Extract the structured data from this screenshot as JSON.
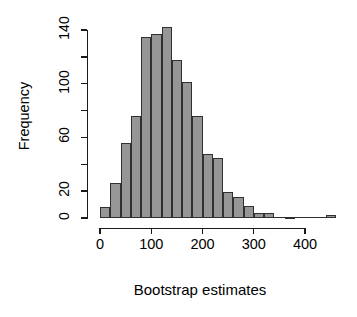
{
  "chart_data": {
    "type": "bar",
    "subtype": "histogram",
    "title": "",
    "xlabel": "Bootstrap estimates",
    "ylabel": "Frequency",
    "xlim": [
      0,
      460
    ],
    "ylim": [
      0,
      145
    ],
    "grid": false,
    "legend": null,
    "bin_width": 20,
    "bar_fill_color": "#969696",
    "bar_border_color": "#303030",
    "axis_color": "#1a1a1a",
    "background_color": "#ffffff",
    "x_ticks": [
      {
        "value": 0,
        "label": "0"
      },
      {
        "value": 100,
        "label": "100"
      },
      {
        "value": 200,
        "label": "200"
      },
      {
        "value": 300,
        "label": "300"
      },
      {
        "value": 400,
        "label": "400"
      }
    ],
    "y_ticks": [
      {
        "value": 0,
        "label": "0",
        "major": true
      },
      {
        "value": 20,
        "label": "20",
        "major": true
      },
      {
        "value": 40,
        "label": "",
        "major": false
      },
      {
        "value": 60,
        "label": "60",
        "major": true
      },
      {
        "value": 80,
        "label": "",
        "major": false
      },
      {
        "value": 100,
        "label": "100",
        "major": true
      },
      {
        "value": 120,
        "label": "",
        "major": false
      },
      {
        "value": 140,
        "label": "140",
        "major": true
      }
    ],
    "bins": [
      {
        "start": 0,
        "end": 20,
        "count": 8
      },
      {
        "start": 20,
        "end": 40,
        "count": 26
      },
      {
        "start": 40,
        "end": 60,
        "count": 56
      },
      {
        "start": 60,
        "end": 80,
        "count": 76
      },
      {
        "start": 80,
        "end": 100,
        "count": 135
      },
      {
        "start": 100,
        "end": 120,
        "count": 137
      },
      {
        "start": 120,
        "end": 140,
        "count": 142
      },
      {
        "start": 140,
        "end": 160,
        "count": 118
      },
      {
        "start": 160,
        "end": 180,
        "count": 101
      },
      {
        "start": 180,
        "end": 200,
        "count": 76
      },
      {
        "start": 200,
        "end": 220,
        "count": 48
      },
      {
        "start": 220,
        "end": 240,
        "count": 45
      },
      {
        "start": 240,
        "end": 260,
        "count": 19
      },
      {
        "start": 260,
        "end": 280,
        "count": 16
      },
      {
        "start": 280,
        "end": 300,
        "count": 9
      },
      {
        "start": 300,
        "end": 320,
        "count": 4
      },
      {
        "start": 320,
        "end": 340,
        "count": 4
      },
      {
        "start": 340,
        "end": 360,
        "count": 0
      },
      {
        "start": 360,
        "end": 380,
        "count": 1
      },
      {
        "start": 380,
        "end": 400,
        "count": 0
      },
      {
        "start": 400,
        "end": 420,
        "count": 0
      },
      {
        "start": 420,
        "end": 440,
        "count": 0
      },
      {
        "start": 440,
        "end": 460,
        "count": 2
      }
    ],
    "categories": [
      "0-20",
      "20-40",
      "40-60",
      "60-80",
      "80-100",
      "100-120",
      "120-140",
      "140-160",
      "160-180",
      "180-200",
      "200-220",
      "220-240",
      "240-260",
      "260-280",
      "280-300",
      "300-320",
      "320-340",
      "340-360",
      "360-380",
      "380-400",
      "400-420",
      "420-440",
      "440-460"
    ],
    "values": [
      8,
      26,
      56,
      76,
      135,
      137,
      142,
      118,
      101,
      76,
      48,
      45,
      19,
      16,
      9,
      4,
      4,
      0,
      1,
      0,
      0,
      0,
      2
    ]
  }
}
